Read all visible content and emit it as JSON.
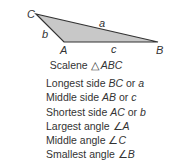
{
  "diagram": {
    "vertices": {
      "A": {
        "label": "A",
        "x": 64,
        "y": 42
      },
      "B": {
        "label": "B",
        "x": 158,
        "y": 42
      },
      "C": {
        "label": "C",
        "x": 36,
        "y": 14
      }
    },
    "sides": {
      "a": {
        "label": "a"
      },
      "b": {
        "label": "b"
      },
      "c": {
        "label": "c"
      }
    },
    "fill_color": "#c8c8c8",
    "stroke_color": "#333333"
  },
  "caption": {
    "prefix": "Scalene ",
    "symbol": "△",
    "name": "ABC"
  },
  "facts": [
    {
      "text": "Longest side ",
      "em1": "BC",
      "mid": " or ",
      "em2": "a"
    },
    {
      "text": "Middle side ",
      "em1": "AB",
      "mid": " or ",
      "em2": "c"
    },
    {
      "text": "Shortest side ",
      "em1": "AC",
      "mid": " or ",
      "em2": "b"
    },
    {
      "text": "Largest angle ",
      "sym": "∠",
      "em1": "A"
    },
    {
      "text": "Middle angle ",
      "sym": "∠",
      "em1": "C"
    },
    {
      "text": "Smallest angle ",
      "sym": "∠",
      "em1": "B"
    }
  ]
}
